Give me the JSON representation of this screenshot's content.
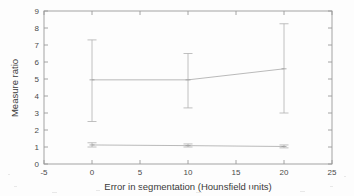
{
  "figure": {
    "background_color": "#fdfdfd",
    "ink_color": "#9a9a9a"
  },
  "chart_data": {
    "type": "line",
    "title": "",
    "xlabel": "Error in segmentation (Hounsfield units)",
    "ylabel": "Measure ratio",
    "xlim": [
      -5,
      25
    ],
    "ylim": [
      0,
      9
    ],
    "xticks": [
      -5,
      0,
      5,
      10,
      15,
      20,
      25
    ],
    "xticklabels": [
      "-5",
      "0",
      "5",
      "10",
      "15",
      "20",
      "25"
    ],
    "yticks": [
      0,
      1,
      2,
      3,
      4,
      5,
      6,
      7,
      8,
      9
    ],
    "yticklabels": [
      "0",
      "1",
      "2",
      "3",
      "4",
      "5",
      "6",
      "7",
      "8",
      "9"
    ],
    "grid": false,
    "legend": null,
    "error_bars": true,
    "x": [
      0,
      10,
      20
    ],
    "series": [
      {
        "name": "upper-series",
        "values": [
          4.95,
          4.95,
          5.6
        ],
        "err_low": [
          2.5,
          3.3,
          3.0
        ],
        "err_high": [
          7.3,
          6.5,
          8.25
        ],
        "color": "#a8a8a8"
      },
      {
        "name": "lower-series",
        "values": [
          1.12,
          1.08,
          1.03
        ],
        "err_low": [
          1.0,
          1.0,
          0.95
        ],
        "err_high": [
          1.25,
          1.18,
          1.12
        ],
        "color": "#a8a8a8"
      }
    ]
  }
}
